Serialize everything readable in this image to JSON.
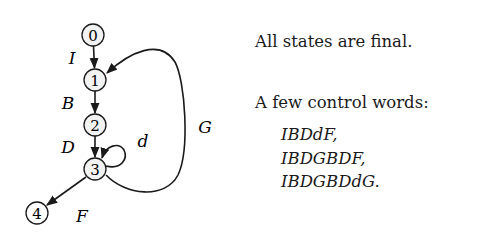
{
  "diagram": {
    "nodes": [
      {
        "id": "0",
        "label": "0",
        "x": 93,
        "y": 35
      },
      {
        "id": "1",
        "label": "1",
        "x": 95,
        "y": 80
      },
      {
        "id": "2",
        "label": "2",
        "x": 95,
        "y": 125
      },
      {
        "id": "3",
        "label": "3",
        "x": 95,
        "y": 169
      },
      {
        "id": "4",
        "label": "4",
        "x": 37,
        "y": 213
      }
    ],
    "edges": [
      {
        "from": "0",
        "to": "1",
        "label": "I"
      },
      {
        "from": "1",
        "to": "2",
        "label": "B"
      },
      {
        "from": "2",
        "to": "3",
        "label": "D"
      },
      {
        "from": "3",
        "to": "3",
        "label": "d"
      },
      {
        "from": "3",
        "to": "1",
        "label": "G"
      },
      {
        "from": "3",
        "to": "4",
        "label": "F"
      }
    ],
    "colors": {
      "stroke": "#1a1a1a",
      "node_fill": "#f2f2f2",
      "background": "#ffffff"
    }
  },
  "notes": {
    "final_states": "All states are final.",
    "control_words_heading": "A few control words:",
    "control_words": [
      "IBDdF,",
      "IBDGBDF,",
      "IBDGBDdG."
    ]
  }
}
